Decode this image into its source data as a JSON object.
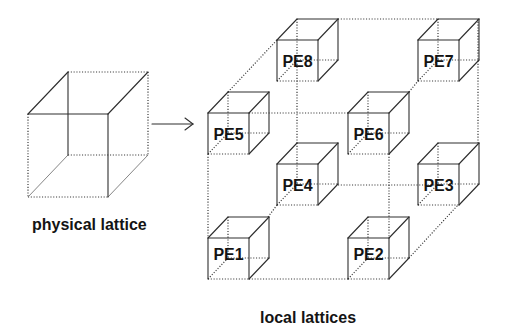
{
  "figure": {
    "physical_label": {
      "text": "physical lattice",
      "x": 32,
      "y": 230,
      "size": 16
    },
    "local_label": {
      "text": "local lattices",
      "x": 260,
      "y": 323,
      "size": 16
    },
    "colors": {
      "line": "#2e2e2e",
      "text": "#141414",
      "background": "#ffffff"
    },
    "physical_cube": {
      "x": 28,
      "y": 114,
      "w": 80,
      "h": 83,
      "dx": 40,
      "dy": -42,
      "solid": [
        "ft",
        "fr",
        "dtl",
        "dtr",
        "bl"
      ],
      "thin": [
        "dbl",
        "dbr"
      ],
      "dotted": [
        "fl",
        "fb",
        "bt",
        "br",
        "bb"
      ]
    },
    "arrow": {
      "x1": 152,
      "y1": 124,
      "x2": 193,
      "y2": 124,
      "head": 8
    },
    "pe_cube": {
      "size": 41,
      "dx": 20,
      "dy": -21,
      "solid": [
        "ft",
        "fl",
        "fr",
        "dtl",
        "dtr",
        "bt",
        "br",
        "dbr"
      ],
      "dotted": [
        "fb",
        "bl",
        "bb",
        "dbl"
      ],
      "label_size": 16
    },
    "nodes": [
      {
        "id": "pe1",
        "label": "PE1",
        "x": 208,
        "y": 238,
        "label_dy": -5
      },
      {
        "id": "pe2",
        "label": "PE2",
        "x": 348,
        "y": 238,
        "label_dy": -5
      },
      {
        "id": "pe3",
        "label": "PE3",
        "x": 418,
        "y": 164,
        "label_dy": 0
      },
      {
        "id": "pe4",
        "label": "PE4",
        "x": 277,
        "y": 164,
        "label_dy": 0
      },
      {
        "id": "pe5",
        "label": "PE5",
        "x": 208,
        "y": 113,
        "label_dy": 0
      },
      {
        "id": "pe6",
        "label": "PE6",
        "x": 348,
        "y": 113,
        "label_dy": 0
      },
      {
        "id": "pe7",
        "label": "PE7",
        "x": 418,
        "y": 40,
        "label_dy": 0
      },
      {
        "id": "pe8",
        "label": "PE8",
        "x": 277,
        "y": 40,
        "label_dy": 0
      }
    ],
    "lattice_edges": [
      {
        "from": "PE8",
        "to": "PE7",
        "pts": [
          338,
          19,
          438,
          19
        ]
      },
      {
        "from": "PE5",
        "to": "PE8",
        "pts": [
          228,
          92,
          277,
          40
        ]
      },
      {
        "from": "PE5",
        "to": "PE6",
        "pts": [
          249,
          113,
          348,
          113
        ]
      },
      {
        "from": "PE6",
        "to": "PE7",
        "pts": [
          409,
          92,
          418,
          81
        ]
      },
      {
        "from": "PE5",
        "to": "PE1",
        "pts": [
          208,
          154,
          208,
          238
        ]
      },
      {
        "from": "PE8",
        "to": "PE4",
        "pts": [
          297,
          61,
          297,
          143
        ]
      },
      {
        "from": "PE6",
        "to": "PE2",
        "pts": [
          389,
          154,
          389,
          238
        ]
      },
      {
        "from": "PE7",
        "to": "PE3",
        "pts": [
          478,
          19,
          478,
          143
        ]
      },
      {
        "from": "PE4",
        "to": "PE3",
        "pts": [
          338,
          185,
          438,
          185
        ]
      },
      {
        "from": "PE1",
        "to": "PE2",
        "pts": [
          249,
          279,
          348,
          279
        ]
      },
      {
        "from": "PE1",
        "to": "PE4",
        "pts": [
          268,
          217,
          277,
          205
        ]
      },
      {
        "from": "PE2",
        "to": "PE3",
        "pts": [
          409,
          258,
          458,
          205
        ]
      }
    ]
  }
}
